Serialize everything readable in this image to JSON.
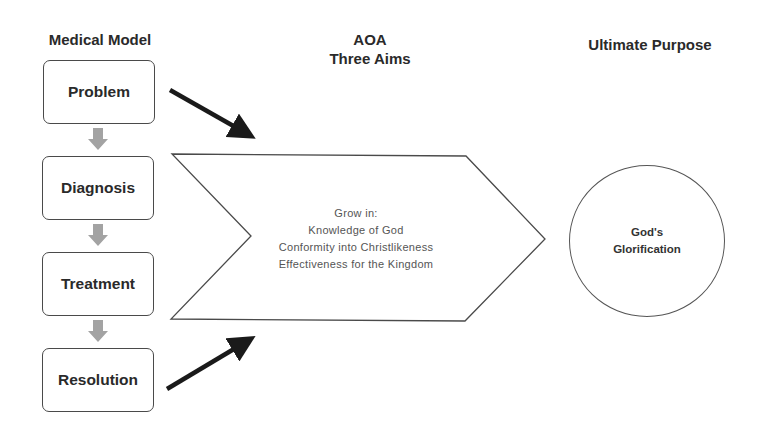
{
  "headings": {
    "left": "Medical Model",
    "center_line1": "AOA",
    "center_line2": "Three Aims",
    "right": "Ultimate Purpose"
  },
  "medical_model": {
    "steps": [
      {
        "label": "Problem"
      },
      {
        "label": "Diagnosis"
      },
      {
        "label": "Treatment"
      },
      {
        "label": "Resolution"
      }
    ],
    "connector_icon": "gray-down-block-arrow"
  },
  "aoa_chevron": {
    "lines": [
      "Grow in:",
      "Knowledge of God",
      "Conformity into Christlikeness",
      "Effectiveness for the Kingdom"
    ]
  },
  "ultimate_purpose": {
    "line1": "God's",
    "line2": "Glorification"
  },
  "colors": {
    "box_border": "#4a4a4a",
    "arrow_black": "#1a1a1a",
    "connector_gray": "#a3a3a3",
    "chevron_text": "#555555"
  }
}
